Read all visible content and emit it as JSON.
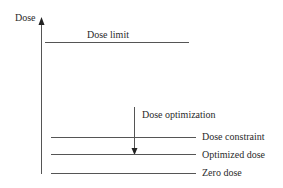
{
  "diagram": {
    "axis": {
      "label": "Dose"
    },
    "levels": {
      "dose_limit": {
        "label": "Dose limit"
      },
      "dose_optimization": {
        "label": "Dose optimization"
      },
      "dose_constraint": {
        "label": "Dose constraint"
      },
      "optimized_dose": {
        "label": "Optimized dose"
      },
      "zero_dose": {
        "label": "Zero dose"
      }
    },
    "colors": {
      "line": "#555555",
      "text": "#2a2a2a",
      "background": "#ffffff"
    }
  }
}
